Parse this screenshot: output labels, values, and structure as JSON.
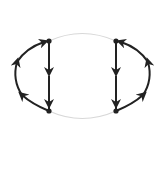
{
  "diagram": {
    "type": "directed-graph",
    "colors": {
      "edge": "#222222",
      "faint_edge": "#d8d8d8",
      "node": "#222222",
      "background": "#ffffff"
    },
    "nodes": [
      {
        "id": "top-left",
        "x": 49,
        "y": 41
      },
      {
        "id": "bottom-left",
        "x": 49,
        "y": 111
      },
      {
        "id": "top-right",
        "x": 116,
        "y": 41
      },
      {
        "id": "bottom-right",
        "x": 116,
        "y": 111
      }
    ],
    "edges": [
      {
        "id": "left-vertical",
        "from": "top-left",
        "to": "bottom-left",
        "arrows": 2,
        "style": "solid"
      },
      {
        "id": "right-vertical",
        "from": "top-right",
        "to": "bottom-right",
        "arrows": 2,
        "style": "solid"
      },
      {
        "id": "left-arc",
        "from": "bottom-left",
        "to": "top-left",
        "arrows": 3,
        "style": "solid",
        "curve": "outer-left"
      },
      {
        "id": "right-arc",
        "from": "bottom-right",
        "to": "top-right",
        "arrows": 3,
        "style": "solid",
        "curve": "outer-right"
      },
      {
        "id": "top-arc",
        "from": "top-left",
        "to": "top-right",
        "arrows": 0,
        "style": "faint"
      },
      {
        "id": "bottom-arc",
        "from": "bottom-left",
        "to": "bottom-right",
        "arrows": 0,
        "style": "faint"
      }
    ]
  }
}
